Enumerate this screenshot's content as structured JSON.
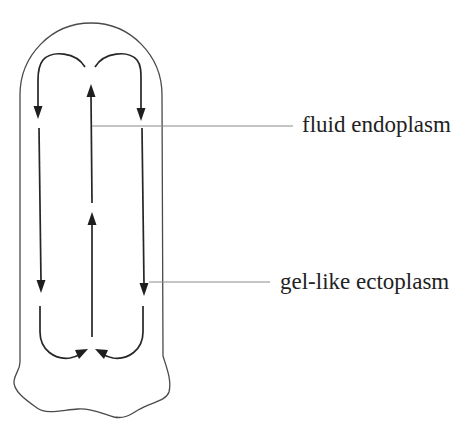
{
  "diagram": {
    "title": "",
    "labels": {
      "endoplasm": "fluid endoplasm",
      "ectoplasm": "gel-like ectoplasm"
    },
    "flow_directions": {
      "center": "up",
      "sides": "down",
      "top": "outward over arcs",
      "bottom": "inward toward center"
    },
    "colors": {
      "background": "#ffffff",
      "outline": "#4a4a4a",
      "arrows": "#262626",
      "leader_lines": "#8a8a8a",
      "text": "#222222"
    }
  }
}
